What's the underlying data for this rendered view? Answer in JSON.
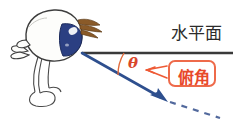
{
  "figure": {
    "type": "geometry-diagram",
    "background_color": "#ffffff",
    "width": 233,
    "height": 124
  },
  "labels": {
    "horizontal_plane": "水平面",
    "angle_symbol": "θ",
    "callout": "俯角"
  },
  "colors": {
    "horizontal_line": "#3a3a3a",
    "sight_line": "#2e4f8e",
    "dashed_line": "#35508c",
    "angle_arc": "#e06a3a",
    "theta_text": "#d9472a",
    "callout_border": "#ee6a4a",
    "callout_text": "#e8482a",
    "bird_body": "#fdfdfb",
    "bird_outline": "#3d3d3d",
    "bird_eye": "#2b3f82",
    "bird_eye_highlight": "#ffffff",
    "bird_lash": "#8a5a28"
  },
  "geometry": {
    "vertex": {
      "x": 82,
      "y": 53
    },
    "horizontal_line": {
      "x1": 82,
      "y1": 53,
      "x2": 233,
      "y2": 53
    },
    "sight_line": {
      "x1": 82,
      "y1": 53,
      "x2": 164,
      "y2": 100
    },
    "dashed_line": {
      "x1": 166,
      "y1": 101,
      "x2": 222,
      "y2": 119
    },
    "arc_radius": 42,
    "angle_degrees": 30
  },
  "elements": {
    "bird_name": "bird-illustration",
    "arrow_name": "line-of-sight-arrow",
    "dashed_name": "sight-line-extension"
  }
}
